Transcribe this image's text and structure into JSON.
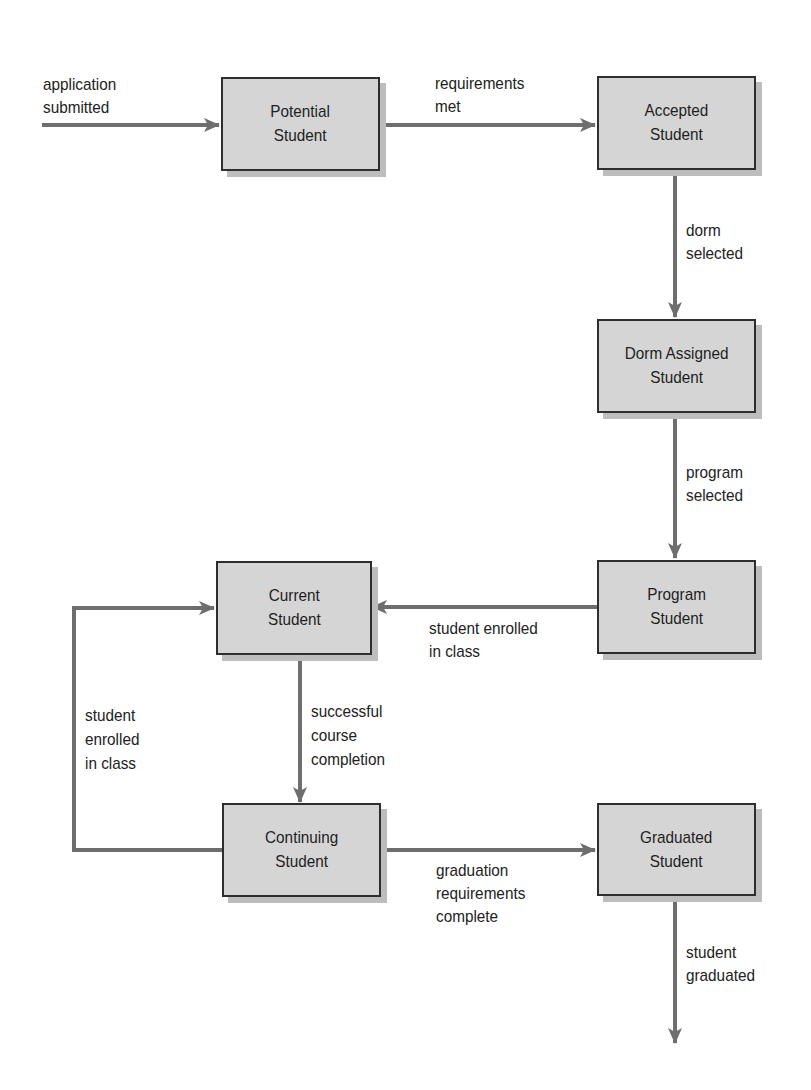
{
  "diagram": {
    "type": "state-transition",
    "colors": {
      "state_fill": "#d5d5d5",
      "state_border": "#2e2e2e",
      "state_shadow": "#bdbdbd",
      "arrow": "#6e6e6e",
      "text": "#222222"
    },
    "states": [
      {
        "id": "potential",
        "label": "Potential\nStudent"
      },
      {
        "id": "accepted",
        "label": "Accepted\nStudent"
      },
      {
        "id": "dorm",
        "label": "Dorm Assigned\nStudent"
      },
      {
        "id": "program",
        "label": "Program\nStudent"
      },
      {
        "id": "current",
        "label": "Current\nStudent"
      },
      {
        "id": "continuing",
        "label": "Continuing\nStudent"
      },
      {
        "id": "graduated",
        "label": "Graduated\nStudent"
      }
    ],
    "transitions": [
      {
        "from": "start",
        "to": "potential",
        "label": "application\nsubmitted"
      },
      {
        "from": "potential",
        "to": "accepted",
        "label": "requirements\nmet"
      },
      {
        "from": "accepted",
        "to": "dorm",
        "label": "dorm\nselected"
      },
      {
        "from": "dorm",
        "to": "program",
        "label": "program\nselected"
      },
      {
        "from": "program",
        "to": "current",
        "label": "student enrolled\nin class"
      },
      {
        "from": "current",
        "to": "continuing",
        "label": "successful\ncourse\ncompletion"
      },
      {
        "from": "continuing",
        "to": "current",
        "label": "student\nenrolled\nin class"
      },
      {
        "from": "continuing",
        "to": "graduated",
        "label": "graduation\nrequirements\ncomplete"
      },
      {
        "from": "graduated",
        "to": "end",
        "label": "student\ngraduated"
      }
    ]
  }
}
